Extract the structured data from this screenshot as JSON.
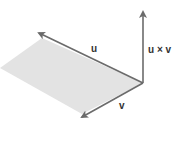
{
  "diagram": {
    "labels": {
      "u": "u",
      "v": "v",
      "cross": "u × v"
    },
    "colors": {
      "arrow": "#6b6b6b",
      "plane": "#e3e3e3",
      "text": "#333333",
      "background": "#ffffff"
    }
  }
}
